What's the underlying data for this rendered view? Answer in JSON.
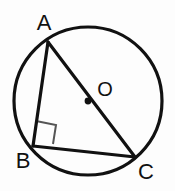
{
  "figure": {
    "background_color": "#fdfdfd",
    "stroke_color": "#111111",
    "marker_color": "#555555"
  },
  "labels": {
    "a": "A",
    "b": "B",
    "c": "C",
    "o": "O"
  },
  "chart_data": {
    "type": "diagram",
    "circle": {
      "name": "circumscribed-circle",
      "center_x": 88,
      "center_y": 101,
      "radius": 74,
      "stroke_width": 3.2
    },
    "points": [
      {
        "name": "A",
        "x": 48,
        "y": 42,
        "label": "A",
        "label_x": 44,
        "label_y": 30,
        "on_circle": true
      },
      {
        "name": "B",
        "x": 33,
        "y": 146,
        "label": "B",
        "label_x": 23,
        "label_y": 168,
        "on_circle": true
      },
      {
        "name": "C",
        "x": 135,
        "y": 157,
        "label": "C",
        "label_x": 146,
        "label_y": 179,
        "on_circle": true
      },
      {
        "name": "O",
        "x": 88,
        "y": 101,
        "label": "O",
        "label_x": 105,
        "label_y": 96,
        "on_circle": false,
        "is_center": true,
        "dot_radius": 3.4
      }
    ],
    "segments": [
      {
        "name": "AB",
        "from": "A",
        "to": "B",
        "x1": 48,
        "y1": 42,
        "x2": 33,
        "y2": 146,
        "stroke_width": 3.2
      },
      {
        "name": "BC",
        "from": "B",
        "to": "C",
        "x1": 33,
        "y1": 146,
        "x2": 135,
        "y2": 157,
        "stroke_width": 3.2
      },
      {
        "name": "AC",
        "from": "A",
        "to": "C",
        "x1": 48,
        "y1": 42,
        "x2": 135,
        "y2": 157,
        "stroke_width": 3.2,
        "is_diameter": true,
        "passes_through": "O"
      }
    ],
    "angle_markers": [
      {
        "name": "right-angle-at-B",
        "at_vertex": "B",
        "degrees": 90,
        "path": "M 36,121 L 56,125 L 53,144",
        "stroke_width": 2.0
      }
    ]
  }
}
